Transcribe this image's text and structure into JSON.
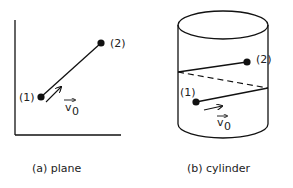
{
  "panels": [
    {
      "id": "a",
      "caption": "(a) plane",
      "point_labels": [
        "(1)",
        "(2)"
      ],
      "velocity_label": "v",
      "velocity_subscript": "0"
    },
    {
      "id": "b",
      "caption": "(b) cylinder",
      "point_labels": [
        "(1)",
        "(2)"
      ],
      "velocity_label": "v",
      "velocity_subscript": "0"
    }
  ],
  "colors": {
    "ink": "#111111",
    "background": "#ffffff"
  }
}
